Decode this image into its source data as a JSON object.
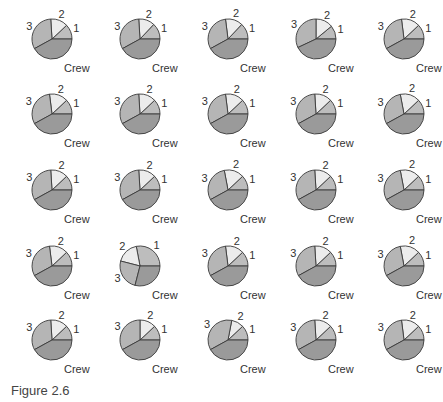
{
  "caption": "Figure 2.6",
  "colors": {
    "crew": "#9a9a9a",
    "one": "#bdbdbd",
    "two": "#ececec",
    "three": "#b5b5b5",
    "stroke": "#3a3a3a"
  },
  "chart_data": {
    "type": "pie",
    "title": "Figure 2.6",
    "layout": "5x5 grid of small multiples",
    "slice_labels": [
      "1",
      "2",
      "3",
      "Crew"
    ],
    "note": "Slice percentages estimated; angles measured counter-clockwise from 3 o'clock, order 1, 2, 3, Crew.",
    "pies": [
      {
        "row": 1,
        "col": 1,
        "values": [
          12,
          14,
          32,
          42
        ]
      },
      {
        "row": 1,
        "col": 2,
        "values": [
          13,
          13,
          32,
          42
        ]
      },
      {
        "row": 1,
        "col": 3,
        "values": [
          13,
          14,
          31,
          42
        ]
      },
      {
        "row": 1,
        "col": 4,
        "values": [
          11,
          14,
          32,
          43
        ]
      },
      {
        "row": 1,
        "col": 5,
        "values": [
          12,
          15,
          31,
          42
        ]
      },
      {
        "row": 2,
        "col": 1,
        "values": [
          12,
          15,
          31,
          42
        ]
      },
      {
        "row": 2,
        "col": 2,
        "values": [
          12,
          14,
          32,
          42
        ]
      },
      {
        "row": 2,
        "col": 3,
        "values": [
          12,
          15,
          31,
          42
        ]
      },
      {
        "row": 2,
        "col": 4,
        "values": [
          12,
          14,
          32,
          42
        ]
      },
      {
        "row": 2,
        "col": 5,
        "values": [
          12,
          16,
          30,
          42
        ]
      },
      {
        "row": 3,
        "col": 1,
        "values": [
          12,
          14,
          32,
          42
        ]
      },
      {
        "row": 3,
        "col": 2,
        "values": [
          12,
          14,
          32,
          42
        ]
      },
      {
        "row": 3,
        "col": 3,
        "values": [
          12,
          16,
          30,
          42
        ]
      },
      {
        "row": 3,
        "col": 4,
        "values": [
          12,
          14,
          32,
          42
        ]
      },
      {
        "row": 3,
        "col": 5,
        "values": [
          12,
          16,
          30,
          42
        ]
      },
      {
        "row": 4,
        "col": 1,
        "values": [
          12,
          15,
          31,
          42
        ]
      },
      {
        "row": 4,
        "col": 2,
        "values": [
          28,
          18,
          25,
          29
        ]
      },
      {
        "row": 4,
        "col": 3,
        "values": [
          12,
          15,
          31,
          42
        ]
      },
      {
        "row": 4,
        "col": 4,
        "values": [
          12,
          14,
          32,
          42
        ]
      },
      {
        "row": 4,
        "col": 5,
        "values": [
          12,
          16,
          30,
          42
        ]
      },
      {
        "row": 5,
        "col": 1,
        "values": [
          12,
          14,
          32,
          42
        ]
      },
      {
        "row": 5,
        "col": 2,
        "values": [
          12,
          13,
          33,
          42
        ]
      },
      {
        "row": 5,
        "col": 3,
        "values": [
          12,
          10,
          36,
          42
        ]
      },
      {
        "row": 5,
        "col": 4,
        "values": [
          12,
          14,
          32,
          42
        ]
      },
      {
        "row": 5,
        "col": 5,
        "values": [
          12,
          15,
          31,
          42
        ]
      }
    ]
  },
  "grid": {
    "col_centers": [
      52,
      140,
      228,
      316,
      404
    ],
    "row_centers": [
      39,
      114,
      190,
      266,
      340
    ],
    "radius": 20
  }
}
